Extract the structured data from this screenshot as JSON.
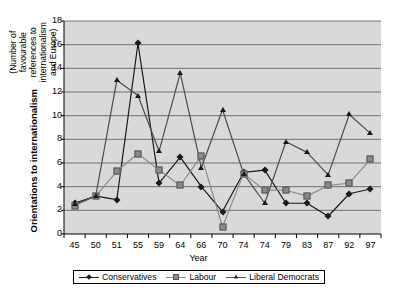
{
  "chart_data": {
    "type": "line",
    "title": "",
    "xlabel": "Year",
    "ylabel": "Orientations to internationalism",
    "ylabel_sub": "(Number of favourable references to internationalism and Europe)",
    "categories": [
      "45",
      "50",
      "51",
      "55",
      "59",
      "64",
      "66",
      "70",
      "74",
      "74",
      "79",
      "83",
      "87",
      "92",
      "97"
    ],
    "ylim": [
      0,
      18
    ],
    "yticks": [
      0,
      2,
      4,
      6,
      8,
      10,
      12,
      14,
      16,
      18
    ],
    "grid": "horizontal",
    "legend_position": "bottom",
    "plot_background": "#d9d9d9",
    "series": [
      {
        "name": "Conservatives",
        "marker": "diamond",
        "color": "#1a1a1a",
        "line_color": "#1a1a1a",
        "values": [
          2.6,
          3.2,
          2.9,
          16.1,
          4.3,
          6.5,
          4.0,
          1.9,
          5.2,
          5.4,
          2.6,
          2.6,
          1.5,
          3.4,
          3.8
        ]
      },
      {
        "name": "Labour",
        "marker": "square",
        "color": "#8a8a8a",
        "line_color": "#8a8a8a",
        "values": [
          2.4,
          3.2,
          5.3,
          6.8,
          5.4,
          4.1,
          6.6,
          0.6,
          5.1,
          3.7,
          3.7,
          3.2,
          4.1,
          4.3,
          6.3
        ]
      },
      {
        "name": "Liberal Democrats",
        "marker": "triangle",
        "color": "#1a1a1a",
        "line_color": "#4d4d4d",
        "values": [
          2.5,
          3.2,
          13.0,
          11.7,
          7.0,
          13.6,
          5.6,
          10.5,
          5.1,
          2.6,
          7.8,
          6.9,
          5.0,
          10.1,
          8.5
        ]
      }
    ]
  },
  "axis": {
    "y_title_main": "Orientations to internationalism",
    "y_title_sub": "(Number of favourable references to internationalism and Europe)",
    "x_title": "Year"
  }
}
